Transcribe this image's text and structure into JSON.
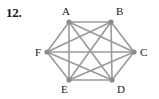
{
  "problem": {
    "number": "12."
  },
  "figure": {
    "name": "complete-graph-k6",
    "edge_color": "#9a9a9a",
    "vertex_color": "#8c8c8c",
    "label_color": "#1a1a1a",
    "edge_width": 1.6,
    "vertex_radius": 2.6,
    "vertices": [
      {
        "id": "A",
        "label": "A",
        "x": 69,
        "y": 22,
        "label_x": 62,
        "label_y": 15
      },
      {
        "id": "B",
        "label": "B",
        "x": 111,
        "y": 22,
        "label_x": 116,
        "label_y": 15
      },
      {
        "id": "C",
        "label": "C",
        "x": 134,
        "y": 52,
        "label_x": 140,
        "label_y": 56
      },
      {
        "id": "D",
        "label": "D",
        "x": 112,
        "y": 80,
        "label_x": 117,
        "label_y": 93
      },
      {
        "id": "E",
        "label": "E",
        "x": 69,
        "y": 80,
        "label_x": 61,
        "label_y": 93
      },
      {
        "id": "F",
        "label": "F",
        "x": 47,
        "y": 52,
        "label_x": 35,
        "label_y": 56
      }
    ],
    "edges": [
      {
        "from": "A",
        "to": "B"
      },
      {
        "from": "A",
        "to": "C"
      },
      {
        "from": "A",
        "to": "D"
      },
      {
        "from": "A",
        "to": "E"
      },
      {
        "from": "A",
        "to": "F"
      },
      {
        "from": "B",
        "to": "C"
      },
      {
        "from": "B",
        "to": "D"
      },
      {
        "from": "B",
        "to": "E"
      },
      {
        "from": "B",
        "to": "F"
      },
      {
        "from": "C",
        "to": "D"
      },
      {
        "from": "C",
        "to": "E"
      },
      {
        "from": "C",
        "to": "F"
      },
      {
        "from": "D",
        "to": "E"
      },
      {
        "from": "D",
        "to": "F"
      },
      {
        "from": "E",
        "to": "F"
      }
    ]
  }
}
